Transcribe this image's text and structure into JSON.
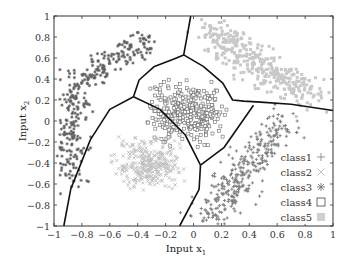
{
  "chart_data": {
    "type": "scatter",
    "title": "",
    "xlabel": "Input x",
    "xlabel_sub": "1",
    "ylabel": "Input x",
    "ylabel_sub": "2",
    "xlim": [
      -1,
      1
    ],
    "ylim": [
      -1,
      1
    ],
    "xticks": [
      -1,
      -0.8,
      -0.6,
      -0.4,
      -0.2,
      0,
      0.2,
      0.4,
      0.6,
      0.8,
      1
    ],
    "yticks": [
      -1,
      -0.8,
      -0.6,
      -0.4,
      -0.2,
      0,
      0.2,
      0.4,
      0.6,
      0.8,
      1
    ],
    "xtick_labels": [
      "−1",
      "−0.8",
      "−0.6",
      "−0.4",
      "−0.2",
      "0",
      "0.2",
      "0.4",
      "0.6",
      "0.8",
      "1"
    ],
    "ytick_labels": [
      "−1",
      "−0.8",
      "−0.6",
      "−0.4",
      "−0.2",
      "0",
      "0.2",
      "0.4",
      "0.6",
      "0.8",
      "1"
    ],
    "grid": false,
    "legend_position": "lower right (inside)",
    "legend": [
      {
        "label": "class1",
        "marker": "plus",
        "color": "#7a7a7a"
      },
      {
        "label": "class2",
        "marker": "cross",
        "color": "#c4c4c4"
      },
      {
        "label": "class3",
        "marker": "asterisk",
        "color": "#8a8a8a"
      },
      {
        "label": "class4",
        "marker": "open-square",
        "color": "#555555"
      },
      {
        "label": "class5",
        "marker": "filled-square",
        "color": "#cfcfcf"
      }
    ],
    "series": [
      {
        "name": "class3",
        "description": "arc-shaped cluster in upper-left, curving from (-0.9,-0.6) up through (-0.85,0.2) to (-0.3,0.8)",
        "color": "#5f5f5f",
        "marker": "asterisk",
        "centerline": [
          [
            -0.88,
            -0.55
          ],
          [
            -0.9,
            -0.3
          ],
          [
            -0.88,
            -0.05
          ],
          [
            -0.85,
            0.15
          ],
          [
            -0.8,
            0.35
          ],
          [
            -0.7,
            0.5
          ],
          [
            -0.55,
            0.6
          ],
          [
            -0.42,
            0.7
          ],
          [
            -0.3,
            0.75
          ]
        ],
        "spread": 0.06,
        "count": 330
      },
      {
        "name": "class4",
        "description": "central cluster of open squares",
        "color": "#6a6a6a",
        "marker": "open-square",
        "center": [
          -0.1,
          0.1
        ],
        "bounds": {
          "x": [
            -0.35,
            0.25
          ],
          "y": [
            -0.25,
            0.4
          ]
        },
        "count": 330
      },
      {
        "name": "class5",
        "description": "elongated light cluster in upper-right",
        "color": "#c8c8c8",
        "marker": "filled-square",
        "centerline": [
          [
            0.1,
            0.85
          ],
          [
            0.3,
            0.7
          ],
          [
            0.5,
            0.5
          ],
          [
            0.7,
            0.35
          ],
          [
            0.85,
            0.2
          ]
        ],
        "spread": 0.08,
        "count": 360
      },
      {
        "name": "class2",
        "description": "light cluster in lower-left-center",
        "color": "#c0c0c0",
        "marker": "cross",
        "center": [
          -0.35,
          -0.45
        ],
        "bounds": {
          "x": [
            -0.6,
            -0.05
          ],
          "y": [
            -0.7,
            -0.15
          ]
        },
        "count": 300
      },
      {
        "name": "class1",
        "description": "diagonal band in lower-right",
        "color": "#7e7e7e",
        "marker": "plus",
        "centerline": [
          [
            0.05,
            -0.95
          ],
          [
            0.2,
            -0.8
          ],
          [
            0.3,
            -0.6
          ],
          [
            0.42,
            -0.35
          ],
          [
            0.55,
            -0.15
          ],
          [
            0.65,
            0.0
          ]
        ],
        "spread": 0.08,
        "count": 330
      }
    ],
    "decision_boundaries": [
      [
        [
          -0.43,
          0.23
        ],
        [
          -0.39,
          0.39
        ],
        [
          -0.28,
          0.52
        ],
        [
          -0.14,
          0.59
        ],
        [
          -0.07,
          0.63
        ],
        [
          -0.04,
          0.85
        ],
        [
          -0.02,
          1.0
        ]
      ],
      [
        [
          -0.07,
          0.63
        ],
        [
          0.07,
          0.52
        ],
        [
          0.21,
          0.36
        ],
        [
          0.28,
          0.2
        ],
        [
          0.36,
          0.19
        ],
        [
          0.48,
          0.18
        ],
        [
          0.7,
          0.16
        ],
        [
          1.0,
          0.1
        ]
      ],
      [
        [
          -0.43,
          0.23
        ],
        [
          -0.6,
          0.11
        ],
        [
          -0.74,
          -0.18
        ],
        [
          -0.88,
          -0.65
        ],
        [
          -0.93,
          -1.0
        ]
      ],
      [
        [
          -0.43,
          0.23
        ],
        [
          -0.24,
          0.11
        ],
        [
          -0.06,
          -0.13
        ],
        [
          0.05,
          -0.42
        ]
      ],
      [
        [
          0.05,
          -0.42
        ],
        [
          0.04,
          -0.65
        ],
        [
          -0.1,
          -1.0
        ]
      ],
      [
        [
          0.05,
          -0.42
        ],
        [
          0.22,
          -0.25
        ],
        [
          0.43,
          0.15
        ]
      ]
    ]
  }
}
